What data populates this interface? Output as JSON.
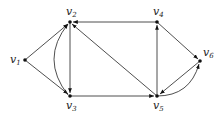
{
  "diagram": {
    "type": "directed-graph",
    "nodes": [
      {
        "id": "v1",
        "label": "v",
        "sub": "1",
        "x": 25,
        "y": 60
      },
      {
        "id": "v2",
        "label": "v",
        "sub": "2",
        "x": 70,
        "y": 22
      },
      {
        "id": "v3",
        "label": "v",
        "sub": "3",
        "x": 70,
        "y": 96
      },
      {
        "id": "v4",
        "label": "v",
        "sub": "4",
        "x": 157,
        "y": 22
      },
      {
        "id": "v5",
        "label": "v",
        "sub": "5",
        "x": 157,
        "y": 96
      },
      {
        "id": "v6",
        "label": "v",
        "sub": "6",
        "x": 200,
        "y": 61
      }
    ],
    "edges": [
      {
        "from": "v1",
        "to": "v2"
      },
      {
        "from": "v1",
        "to": "v3"
      },
      {
        "from": "v2",
        "to": "v3",
        "shape": "straight"
      },
      {
        "from": "v3",
        "to": "v2",
        "shape": "curved"
      },
      {
        "from": "v4",
        "to": "v2"
      },
      {
        "from": "v5",
        "to": "v2"
      },
      {
        "from": "v3",
        "to": "v5"
      },
      {
        "from": "v5",
        "to": "v4"
      },
      {
        "from": "v4",
        "to": "v6"
      },
      {
        "from": "v5",
        "to": "v6",
        "shape": "curved"
      },
      {
        "from": "v6",
        "to": "v5",
        "shape": "straight"
      }
    ]
  }
}
